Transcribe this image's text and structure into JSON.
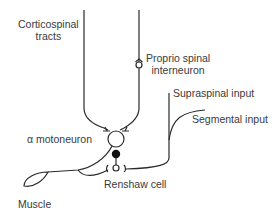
{
  "labels": {
    "corticospinal": [
      "Corticospinal",
      "tracts"
    ],
    "propriospinal": [
      "Proprio spinal",
      "interneuron"
    ],
    "supraspinal": "Supraspinal input",
    "segmental": "Segmental input",
    "motoneuron": "α motoneuron",
    "renshaw": "Renshaw cell",
    "muscle": "Muscle"
  },
  "colors": {
    "stroke": "#2a2a2a",
    "text": "#3a3a3a",
    "inhibitory_synapse": "#111111"
  }
}
